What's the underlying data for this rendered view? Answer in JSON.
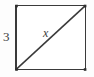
{
  "figure": {
    "type": "geometry-diagram",
    "canvas": {
      "width": 94,
      "height": 77
    },
    "background_color": "#fdfdfd",
    "shape": {
      "name": "square",
      "fill_color": "#ffffff",
      "stroke_color": "#3a3a3a",
      "stroke_width": 1.6,
      "bounds": {
        "x": 16,
        "y": 5.5,
        "width": 69.5,
        "height": 64
      },
      "corners": [
        {
          "name": "top-left",
          "x": 16,
          "y": 5.5
        },
        {
          "name": "top-right",
          "x": 85.5,
          "y": 5.5
        },
        {
          "name": "bottom-right",
          "x": 85.5,
          "y": 69.5
        },
        {
          "name": "bottom-left",
          "x": 16,
          "y": 69.5
        }
      ]
    },
    "diagonal": {
      "name": "diagonal",
      "stroke_color": "#3a3a3a",
      "stroke_width": 1.6,
      "from": {
        "x": 17,
        "y": 68.5
      },
      "to": {
        "x": 84.5,
        "y": 6.5
      }
    },
    "labels": {
      "side": {
        "text": "3",
        "meaning": "length of the left side of the square",
        "style": "upright",
        "color": "#3b3b3b",
        "position": {
          "x": 3,
          "y": 30
        }
      },
      "diagonal": {
        "text": "x",
        "meaning": "unknown length of the diagonal",
        "style": "italic",
        "color": "#3b3b3b",
        "position": {
          "x": 43,
          "y": 27
        }
      }
    }
  }
}
